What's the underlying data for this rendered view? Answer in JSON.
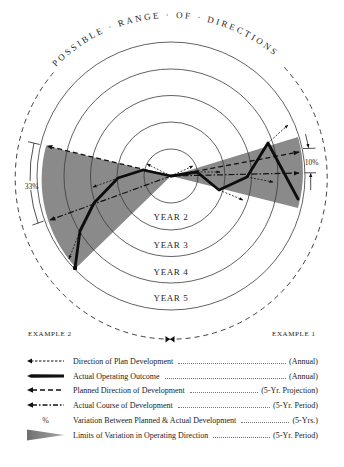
{
  "diagram": {
    "title_arc": "POSSIBLE · RANGE · OF · DIRECTIONS",
    "ring_labels": [
      "YEAR 2",
      "YEAR 3",
      "YEAR 4",
      "YEAR 5"
    ],
    "variation_left": "33%",
    "variation_right": "10%",
    "example_left": "EXAMPLE 2",
    "example_right": "EXAMPLE 1"
  },
  "colors": {
    "wedge": "#8a8a8a",
    "ink": "#1f1f1f",
    "rings": "#3a3a3a",
    "background": "#ffffff"
  },
  "legend": [
    {
      "icon": "fine-dashed-arrow",
      "label": "Direction of Plan Development",
      "period": "(Annual)"
    },
    {
      "icon": "thick-solid-line",
      "label": "Actual Operating Outcome",
      "period": "(Annual)"
    },
    {
      "icon": "long-dashed-arrow",
      "label": "Planned Direction of Development",
      "period": "(5-Yr. Projection)"
    },
    {
      "icon": "dash-dot-arrow",
      "label": "Actual Course of Development",
      "period": "(5-Yr. Period)"
    },
    {
      "icon": "percent-symbol",
      "symbol": "%",
      "label": "Variation Between Planned & Actual Development",
      "period": "(5-Yrs.)"
    },
    {
      "icon": "gray-wedge",
      "label": "Limits of Variation in Operating Direction",
      "period": "(5-Yr. Period)"
    }
  ]
}
